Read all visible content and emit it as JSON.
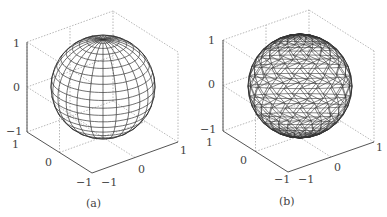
{
  "figure": {
    "panels": [
      {
        "id": "a",
        "caption": "(a)",
        "description": "latitude-longitude wireframe sphere",
        "z_ticks": [
          "1",
          "0",
          "−1"
        ],
        "y_ticks": [
          "1",
          "0",
          "−1"
        ],
        "x_ticks": [
          "−1",
          "0",
          "1"
        ]
      },
      {
        "id": "b",
        "caption": "(b)",
        "description": "triangulated wireframe sphere",
        "z_ticks": [
          "1",
          "0",
          "−1"
        ],
        "y_ticks": [
          "1",
          "0",
          "−1"
        ],
        "x_ticks": [
          "−1",
          "0",
          "1"
        ]
      }
    ],
    "colors": {
      "wire": "#333333",
      "axis": "#555555",
      "grid": "#999999"
    }
  }
}
